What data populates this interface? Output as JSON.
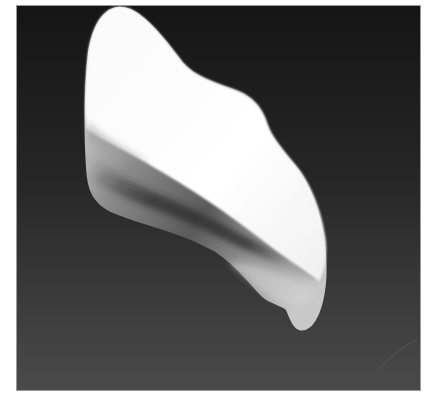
{
  "image": {
    "alt": "Rendered white curved shell-like 3D object on a dark gradient background",
    "subject": "white twisted shell surface",
    "colors": {
      "background_top": "#161616",
      "background_bottom": "#4a4a4a",
      "frame_border": "#9a9a9a",
      "page_background": "#ffffff",
      "surface_highlight": "#ffffff",
      "surface_mid": "#d8d8d8",
      "surface_shadow": "#3a3a3a",
      "underside_light": "#bdbdbd"
    }
  }
}
